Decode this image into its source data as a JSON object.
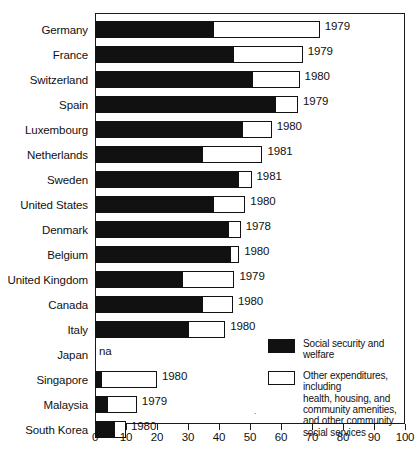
{
  "chart_data": {
    "type": "bar",
    "orientation": "horizontal",
    "stacked": true,
    "title": "",
    "xlabel": "",
    "ylabel": "",
    "xlim": [
      0,
      100
    ],
    "xticks": [
      0,
      10,
      20,
      30,
      40,
      50,
      60,
      70,
      80,
      90,
      100
    ],
    "grid": false,
    "legend_position": "inside-bottom-right",
    "categories": [
      "Germany",
      "France",
      "Switzerland",
      "Spain",
      "Luxembourg",
      "Netherlands",
      "Sweden",
      "United States",
      "Denmark",
      "Belgium",
      "United Kingdom",
      "Canada",
      "Italy",
      "Japan",
      "Singapore",
      "Malaysia",
      "South Korea"
    ],
    "series": [
      {
        "name": "Social security and welfare",
        "values": [
          38,
          44.5,
          50.5,
          58,
          47.5,
          34.5,
          46,
          38,
          43,
          43.5,
          28,
          34.5,
          30,
          null,
          2,
          4,
          6
        ]
      },
      {
        "name": "Other expenditures, including health, housing, and community amenities, and other community social services",
        "values": [
          34.5,
          22.5,
          15.5,
          7.5,
          9.5,
          19.5,
          4.5,
          10.5,
          4,
          3,
          17,
          10,
          12,
          null,
          18,
          9.5,
          4
        ]
      }
    ],
    "totals": [
      72.5,
      67,
      66,
      65.5,
      57,
      54,
      50.5,
      48.5,
      47,
      46.5,
      45,
      44.5,
      42,
      null,
      20,
      13.5,
      10
    ],
    "point_annotations": [
      "1979",
      "1979",
      "1980",
      "1979",
      "1980",
      "1981",
      "1981",
      "1980",
      "1978",
      "1980",
      "1979",
      "1980",
      "1980",
      "na",
      "1980",
      "1979",
      "1980"
    ]
  },
  "rows": [
    {
      "label": "Germany",
      "black": 38,
      "white_end": 72.5,
      "year": "1979"
    },
    {
      "label": "France",
      "black": 44.5,
      "white_end": 67,
      "year": "1979"
    },
    {
      "label": "Switzerland",
      "black": 50.5,
      "white_end": 66,
      "year": "1980"
    },
    {
      "label": "Spain",
      "black": 58,
      "white_end": 65.5,
      "year": "1979"
    },
    {
      "label": "Luxembourg",
      "black": 47.5,
      "white_end": 57,
      "year": "1980"
    },
    {
      "label": "Netherlands",
      "black": 34.5,
      "white_end": 54,
      "year": "1981"
    },
    {
      "label": "Sweden",
      "black": 46,
      "white_end": 50.5,
      "year": "1981"
    },
    {
      "label": "United States",
      "black": 38,
      "white_end": 48.5,
      "year": "1980"
    },
    {
      "label": "Denmark",
      "black": 43,
      "white_end": 47,
      "year": "1978"
    },
    {
      "label": "Belgium",
      "black": 43.5,
      "white_end": 46.5,
      "year": "1980"
    },
    {
      "label": "United Kingdom",
      "black": 28,
      "white_end": 45,
      "year": "1979"
    },
    {
      "label": "Canada",
      "black": 34.5,
      "white_end": 44.5,
      "year": "1980"
    },
    {
      "label": "Italy",
      "black": 30,
      "white_end": 42,
      "year": "1980"
    },
    {
      "label": "Japan",
      "black": 0,
      "white_end": 0,
      "year": "na"
    },
    {
      "label": "Singapore",
      "black": 2,
      "white_end": 20,
      "year": "1980"
    },
    {
      "label": "Malaysia",
      "black": 4,
      "white_end": 13.5,
      "year": "1979"
    },
    {
      "label": "South Korea",
      "black": 6,
      "white_end": 10,
      "year": "1980"
    }
  ],
  "axis": {
    "ticks": [
      "0",
      "10",
      "20",
      "30",
      "40",
      "50",
      "60",
      "70",
      "80",
      "90",
      "100"
    ]
  },
  "legend": {
    "items": [
      {
        "swatch": "black",
        "text": "Social security and\nwelfare"
      },
      {
        "swatch": "white",
        "text": "Other expenditures, including\nhealth, housing, and\ncommunity amenities,\nand other community\nsocial services"
      }
    ]
  },
  "colors": {
    "series_black": "#111111",
    "series_white": "#ffffff",
    "frame": "#1a1a1a"
  }
}
